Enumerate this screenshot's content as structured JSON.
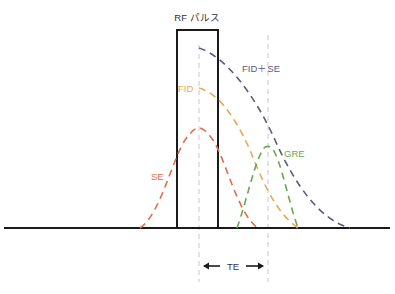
{
  "diagram": {
    "title": "RF パルス",
    "labels": {
      "fid_se": "FID＋SE",
      "fid": "FID",
      "se": "SE",
      "gre": "GRE",
      "te": "TE"
    },
    "colors": {
      "axis": "#1a1a1a",
      "pulse": "#1a1a1a",
      "fid_se": "#5a5a85",
      "fid": "#e8a856",
      "se": "#de6f4a",
      "gre": "#6aa84f",
      "guide": "#c8c8d0",
      "text": "#333333"
    },
    "elements": [
      {
        "id": "rf-pulse",
        "kind": "rectangle",
        "x1": 177,
        "x2": 218,
        "top": 30,
        "baseline": 228
      },
      {
        "id": "fid-se-curve",
        "kind": "dashed-decay"
      },
      {
        "id": "fid-curve",
        "kind": "dashed-decay"
      },
      {
        "id": "se-curve",
        "kind": "dashed-peak"
      },
      {
        "id": "gre-curve",
        "kind": "dashed-peak"
      },
      {
        "id": "te-interval",
        "kind": "double-arrow"
      }
    ]
  }
}
